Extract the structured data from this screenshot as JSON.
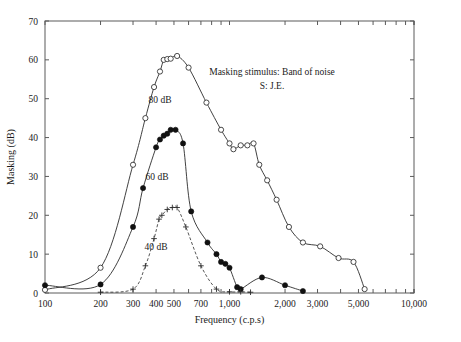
{
  "chart_data": {
    "type": "line",
    "title": "",
    "xlabel": "Frequency (c.p.s)",
    "ylabel": "Masking (dB)",
    "xscale": "log",
    "xlim": [
      100,
      10000
    ],
    "ylim": [
      0,
      70
    ],
    "grid": false,
    "legend": "inline-labels",
    "xticks": [
      100,
      200,
      300,
      400,
      500,
      700,
      1000,
      2000,
      3000,
      5000,
      10000
    ],
    "xtick_labels": [
      "100",
      "200",
      "300",
      "400",
      "500",
      "700",
      "1,000",
      "2,000",
      "3,000",
      "5,000",
      "10,000"
    ],
    "yticks": [
      0,
      10,
      20,
      30,
      40,
      50,
      60,
      70
    ],
    "ytick_labels": [
      "0",
      "10",
      "20",
      "30",
      "40",
      "50",
      "60",
      "70"
    ],
    "annotations": [
      {
        "id": "masking-stimulus-note",
        "text": "Masking stimulus: Band of noise",
        "x": 1700,
        "y": 56
      },
      {
        "id": "subject-note",
        "text": "S: J.E.",
        "x": 1700,
        "y": 52.5
      }
    ],
    "series": [
      {
        "name": "80 dB",
        "label": "80 dB",
        "marker": "open-circle",
        "linestyle": "solid",
        "label_x": 420,
        "label_y": 49,
        "points": [
          {
            "x": 100,
            "y": 0.8
          },
          {
            "x": 200,
            "y": 6.5
          },
          {
            "x": 300,
            "y": 33
          },
          {
            "x": 350,
            "y": 45
          },
          {
            "x": 390,
            "y": 53
          },
          {
            "x": 420,
            "y": 57
          },
          {
            "x": 440,
            "y": 60
          },
          {
            "x": 460,
            "y": 60.2
          },
          {
            "x": 480,
            "y": 60.3
          },
          {
            "x": 520,
            "y": 61
          },
          {
            "x": 600,
            "y": 58
          },
          {
            "x": 750,
            "y": 49
          },
          {
            "x": 900,
            "y": 42
          },
          {
            "x": 1000,
            "y": 38.5
          },
          {
            "x": 1050,
            "y": 37
          },
          {
            "x": 1150,
            "y": 38
          },
          {
            "x": 1250,
            "y": 38
          },
          {
            "x": 1350,
            "y": 38.5
          },
          {
            "x": 1450,
            "y": 33
          },
          {
            "x": 1600,
            "y": 29
          },
          {
            "x": 1800,
            "y": 24
          },
          {
            "x": 2100,
            "y": 17
          },
          {
            "x": 2500,
            "y": 13
          },
          {
            "x": 3100,
            "y": 12
          },
          {
            "x": 3900,
            "y": 9
          },
          {
            "x": 4700,
            "y": 8
          },
          {
            "x": 5400,
            "y": 1
          }
        ]
      },
      {
        "name": "60 dB",
        "label": "60 dB",
        "marker": "filled-circle",
        "linestyle": "solid",
        "label_x": 405,
        "label_y": 29,
        "points": [
          {
            "x": 100,
            "y": 2
          },
          {
            "x": 200,
            "y": 2.2
          },
          {
            "x": 300,
            "y": 17
          },
          {
            "x": 340,
            "y": 27
          },
          {
            "x": 400,
            "y": 37.5
          },
          {
            "x": 420,
            "y": 39.5
          },
          {
            "x": 440,
            "y": 40.5
          },
          {
            "x": 460,
            "y": 41
          },
          {
            "x": 480,
            "y": 42
          },
          {
            "x": 510,
            "y": 42
          },
          {
            "x": 560,
            "y": 38.5
          },
          {
            "x": 620,
            "y": 21
          },
          {
            "x": 760,
            "y": 13
          },
          {
            "x": 850,
            "y": 10
          },
          {
            "x": 900,
            "y": 8
          },
          {
            "x": 950,
            "y": 7.5
          },
          {
            "x": 1000,
            "y": 6.5
          },
          {
            "x": 1100,
            "y": 1.5
          },
          {
            "x": 1150,
            "y": 1
          },
          {
            "x": 1500,
            "y": 4
          },
          {
            "x": 2000,
            "y": 2
          },
          {
            "x": 2500,
            "y": 0.5
          }
        ]
      },
      {
        "name": "40 dB",
        "label": "40 dB",
        "marker": "plus",
        "linestyle": "dashed",
        "label_x": 400,
        "label_y": 11,
        "points": [
          {
            "x": 200,
            "y": 0.2
          },
          {
            "x": 300,
            "y": 1
          },
          {
            "x": 350,
            "y": 7
          },
          {
            "x": 390,
            "y": 14
          },
          {
            "x": 415,
            "y": 19
          },
          {
            "x": 430,
            "y": 20
          },
          {
            "x": 460,
            "y": 21.5
          },
          {
            "x": 490,
            "y": 22
          },
          {
            "x": 520,
            "y": 22
          },
          {
            "x": 580,
            "y": 17
          },
          {
            "x": 700,
            "y": 7
          },
          {
            "x": 850,
            "y": 1
          },
          {
            "x": 1000,
            "y": 0.3
          },
          {
            "x": 1150,
            "y": 0.3
          },
          {
            "x": 1300,
            "y": 0.2
          }
        ]
      }
    ]
  },
  "figure": {
    "axis_x_title": "Frequency (c.p.s)",
    "axis_y_title": "Masking (dB)"
  }
}
